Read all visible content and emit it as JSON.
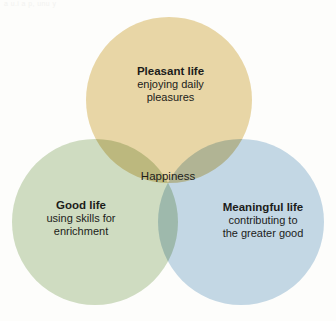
{
  "figure": {
    "artifact_text": "a u.i a p, unu y",
    "background_color": "#fdfdfb",
    "text_color": "#1c1c1a"
  },
  "circles": [
    {
      "id": "pleasant",
      "name": "Pleasant life",
      "color": "#e8d6a6"
    },
    {
      "id": "good",
      "name": "Good life",
      "color": "#cfdcc1"
    },
    {
      "id": "meaningful",
      "name": "Meaningful life",
      "color": "#c3d7e4"
    }
  ],
  "labels": {
    "pleasant": {
      "heading": "Pleasant life",
      "line1": "enjoying daily",
      "line2": "pleasures"
    },
    "good": {
      "heading": "Good life",
      "line1": "using skills for",
      "line2": "enrichment"
    },
    "meaningful": {
      "heading": "Meaningful life",
      "line1": "contributing to",
      "line2": "the greater good"
    },
    "center": {
      "text": "Happiness"
    }
  }
}
